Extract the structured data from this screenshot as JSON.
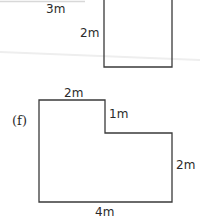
{
  "figure_e": {
    "labels": {
      "top": "3m",
      "side": "2m"
    }
  },
  "figure_f": {
    "tag": "(f)",
    "labels": {
      "top": "2m",
      "step": "1m",
      "right": "2m",
      "bottom": "4m"
    }
  },
  "colors": {
    "stroke": "#3a3a3a",
    "text": "#2a2a2a",
    "background": "#ffffff",
    "artifact": "#e6e6e6"
  }
}
